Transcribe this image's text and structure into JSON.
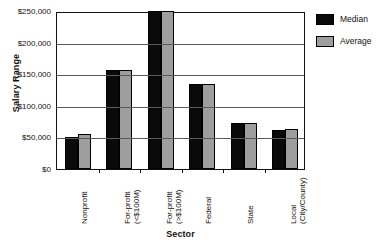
{
  "chart_data": {
    "type": "bar",
    "title": "",
    "xlabel": "Sector",
    "ylabel": "Salary Range",
    "categories": [
      "Nonprofit",
      "For-profit\n(<$100M)",
      "For-profit\n(>$100M)",
      "Federal",
      "State",
      "Local\n(City/County)"
    ],
    "series": [
      {
        "name": "Median",
        "color": "#0a0a0a",
        "values": [
          50000,
          157000,
          250000,
          135000,
          73000,
          62000
        ]
      },
      {
        "name": "Average",
        "color": "#9e9e9e",
        "values": [
          55000,
          157000,
          250000,
          135000,
          73000,
          64000
        ]
      }
    ],
    "ylim": [
      0,
      250000
    ],
    "ytick_values": [
      0,
      50000,
      100000,
      150000,
      200000,
      250000
    ],
    "ytick_labels": [
      "$0",
      "$50,000",
      "$100,000",
      "$150,000",
      "$200,000",
      "$250,000"
    ],
    "grid": true,
    "legend_position": "right"
  },
  "legend": {
    "entries": [
      {
        "label": "Median"
      },
      {
        "label": "Average"
      }
    ]
  }
}
